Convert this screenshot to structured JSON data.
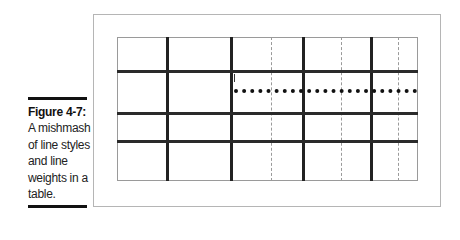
{
  "figure": {
    "label": "Figure 4-7:",
    "caption_lines": [
      "A mishmash",
      "of line styles",
      "and line",
      "weights in a",
      "table."
    ]
  },
  "table": {
    "rows": 4,
    "columns": 8,
    "description": "Empty grid with mixed thick solid, dashed, and dotted borders",
    "line_color": "#222222",
    "dashed_color": "#9a9a9a"
  }
}
